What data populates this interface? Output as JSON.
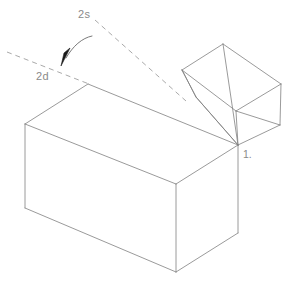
{
  "diagram": {
    "background_color": "#ffffff",
    "line_color": "#808080",
    "dash_color": "#9a9a9a",
    "label_color": "#8a8a8a",
    "arrow_fill": "#1a1a1a",
    "line_width": 0.8,
    "labels": {
      "source_axis": "2s",
      "destination_axis": "2d",
      "hinge_vertex": "1."
    },
    "label_positions": {
      "source_axis": {
        "x": 78,
        "y": 18
      },
      "destination_axis": {
        "x": 36,
        "y": 80
      },
      "hinge_vertex": {
        "x": 243,
        "y": 158
      }
    },
    "geometry": {
      "large_box": {
        "name": "main-box",
        "type": "wireframe-cuboid",
        "vertices": {
          "top_back_left": {
            "x": 25,
            "y": 124
          },
          "top_back_right": {
            "x": 176,
            "y": 184
          },
          "top_front_left": {
            "x": 88,
            "y": 84
          },
          "top_front_right": {
            "x": 238,
            "y": 145
          },
          "bottom_back_left": {
            "x": 25,
            "y": 208
          },
          "bottom_front_mid": {
            "x": 176,
            "y": 272
          },
          "bottom_right": {
            "x": 238,
            "y": 233
          }
        },
        "edges": [
          "top_front_left -> top_front_right",
          "top_front_left -> top_back_left",
          "top_back_left -> top_back_right",
          "top_back_right -> top_front_right",
          "top_back_left -> bottom_back_left",
          "top_back_right -> bottom_front_mid",
          "top_front_right -> bottom_right",
          "bottom_back_left -> bottom_front_mid",
          "bottom_front_mid -> bottom_right"
        ]
      },
      "small_box": {
        "name": "lid-box",
        "type": "wireframe-open-box",
        "vertices": {
          "rim_left": {
            "x": 182,
            "y": 70
          },
          "rim_top": {
            "x": 223,
            "y": 44
          },
          "rim_right": {
            "x": 281,
            "y": 84
          },
          "rim_front": {
            "x": 236,
            "y": 111
          },
          "base_left": {
            "x": 196,
            "y": 97
          },
          "base_front": {
            "x": 238,
            "y": 145
          },
          "base_right": {
            "x": 280,
            "y": 125
          }
        }
      },
      "dashed_lines": [
        {
          "name": "source-ray",
          "label": "2s",
          "from": {
            "x": 95,
            "y": 20
          },
          "to": {
            "x": 186,
            "y": 101
          }
        },
        {
          "name": "destination-ray",
          "label": "2d",
          "from": {
            "x": 7,
            "y": 52
          },
          "to": {
            "x": 89,
            "y": 84
          }
        }
      ],
      "rotation_arrow": {
        "name": "rotation-arc",
        "path": "M 92,36 C 83,37 74,45 66,57",
        "arrowhead_tip": {
          "x": 62,
          "y": 65
        }
      }
    }
  }
}
